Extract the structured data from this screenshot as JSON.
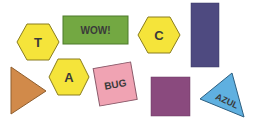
{
  "shapes": {
    "hex_t": {
      "label": "T",
      "fill": "#f5e43a",
      "stroke": "#8a7d1e"
    },
    "rect_wow": {
      "label": "WOW!",
      "fill": "#73a842",
      "stroke": "#4d7a2a"
    },
    "hex_c": {
      "label": "C",
      "fill": "#f5e43a",
      "stroke": "#8a7d1e"
    },
    "rect_purple": {
      "label": "",
      "fill": "#4e4a80",
      "stroke": "#3b3863"
    },
    "tri_orange": {
      "label": "",
      "fill": "#d18a4a",
      "stroke": "#8f5e2e"
    },
    "hex_a": {
      "label": "A",
      "fill": "#f5e43a",
      "stroke": "#8a7d1e"
    },
    "rect_bug": {
      "label": "BUG",
      "fill": "#f0a3b3",
      "stroke": "#8a5a6a"
    },
    "square_mauve": {
      "label": "",
      "fill": "#8a4a7e",
      "stroke": "#6a3a60"
    },
    "tri_azul": {
      "label": "AZUL",
      "fill": "#5fb0e0",
      "stroke": "#2e5f80"
    }
  }
}
